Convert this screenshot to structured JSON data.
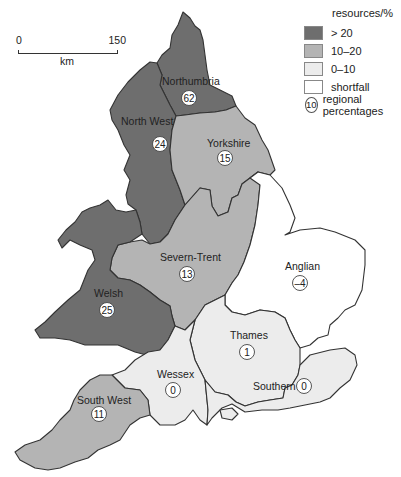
{
  "legend": {
    "title": "resources/%",
    "items": [
      {
        "label": "> 20",
        "color": "#6e6e6e"
      },
      {
        "label": "10–20",
        "color": "#b4b4b4"
      },
      {
        "label": "0–10",
        "color": "#ececec"
      },
      {
        "label": "shortfall",
        "color": "#ffffff"
      }
    ],
    "circle_example": "10",
    "circle_label": "regional percentages"
  },
  "scale": {
    "start": "0",
    "end": "150",
    "unit": "km"
  },
  "regions": [
    {
      "name": "Northumbria",
      "value": "62",
      "category": "> 20",
      "color": "#6e6e6e"
    },
    {
      "name": "North West",
      "value": "24",
      "category": "> 20",
      "color": "#6e6e6e"
    },
    {
      "name": "Yorkshire",
      "value": "15",
      "category": "10–20",
      "color": "#b4b4b4"
    },
    {
      "name": "Severn-Trent",
      "value": "13",
      "category": "10–20",
      "color": "#b4b4b4"
    },
    {
      "name": "Welsh",
      "value": "25",
      "category": "> 20",
      "color": "#6e6e6e"
    },
    {
      "name": "Anglian",
      "value": "–4",
      "category": "shortfall",
      "color": "#ffffff"
    },
    {
      "name": "Thames",
      "value": "1",
      "category": "0–10",
      "color": "#ececec"
    },
    {
      "name": "Wessex",
      "value": "0",
      "category": "0–10",
      "color": "#ececec"
    },
    {
      "name": "Southern",
      "value": "0",
      "category": "0–10",
      "color": "#ececec"
    },
    {
      "name": "South West",
      "value": "11",
      "category": "10–20",
      "color": "#b4b4b4"
    }
  ]
}
